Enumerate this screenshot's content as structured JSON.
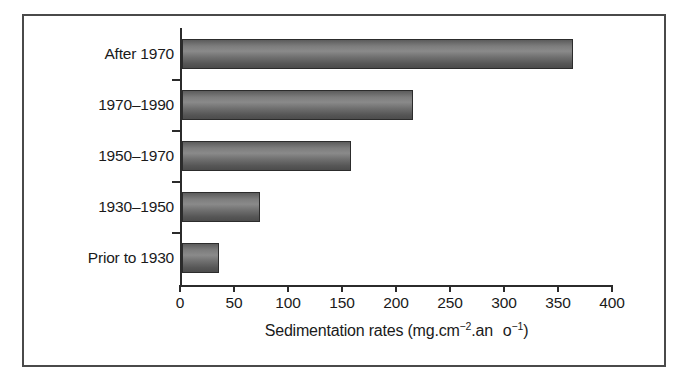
{
  "figure": {
    "frame_color": "#4a4a4a",
    "background": "#ffffff"
  },
  "axis": {
    "title_main": "Sedimentation rates (mg.cm",
    "title_sup1": "−2",
    "title_mid": ".an",
    "title_o": "o",
    "title_sup2": "−1",
    "title_close": ")",
    "title_full": "Sedimentation rates (mg.cm−2.an  o−1)",
    "tick_labels": [
      "0",
      "50",
      "100",
      "150",
      "200",
      "250",
      "300",
      "350",
      "400"
    ],
    "tick_values": [
      0,
      50,
      100,
      150,
      200,
      250,
      300,
      350,
      400
    ]
  },
  "chart_data": {
    "type": "bar",
    "orientation": "horizontal",
    "title": "",
    "xlabel": "Sedimentation rates (mg.cm−2.an  o−1)",
    "ylabel": "",
    "categories": [
      "After 1970",
      "1970–1990",
      "1950–1970",
      "1930–1950",
      "Prior to 1930"
    ],
    "values": [
      360,
      212,
      155,
      70,
      32
    ],
    "xlim": [
      0,
      400
    ],
    "xticks": [
      0,
      50,
      100,
      150,
      200,
      250,
      300,
      350,
      400
    ],
    "grid": false,
    "legend": "none",
    "bar_fill_color": "#6e6e6e",
    "bar_edge_color": "#2c2c2c"
  }
}
